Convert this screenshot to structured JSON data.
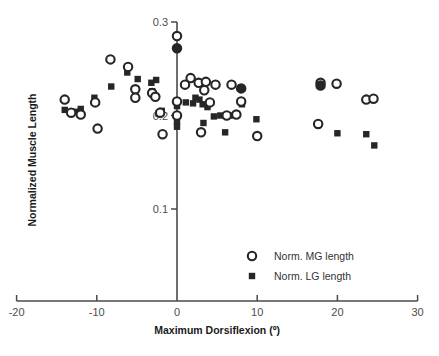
{
  "chart_data": {
    "type": "scatter",
    "title": "",
    "xlabel": "Maximum Dorsiflexion (º)",
    "ylabel": "Normalized Muscle Length",
    "xlim": [
      -20,
      30
    ],
    "ylim": [
      0.055,
      0.305
    ],
    "xticks": [
      -20,
      -10,
      0,
      10,
      20,
      30
    ],
    "xticklabels": [
      "-20",
      "-10",
      "0",
      "10",
      "20",
      "30"
    ],
    "yticks": [
      0.1,
      0.2,
      0.3
    ],
    "yticklabels": [
      "0.1",
      "0.2",
      "0.3"
    ],
    "grid": false,
    "legend_position": "lower right",
    "series": [
      {
        "name": "Norm. MG length",
        "marker": "open-circle",
        "color": "#262626",
        "points": [
          [
            -14.0,
            0.217
          ],
          [
            -13.2,
            0.203
          ],
          [
            -12.0,
            0.201
          ],
          [
            -10.2,
            0.214
          ],
          [
            -9.9,
            0.186
          ],
          [
            -8.3,
            0.26
          ],
          [
            -6.1,
            0.252
          ],
          [
            -5.2,
            0.228
          ],
          [
            -5.2,
            0.219
          ],
          [
            -3.1,
            0.224
          ],
          [
            -2.7,
            0.22
          ],
          [
            -2.1,
            0.203
          ],
          [
            -1.8,
            0.18
          ],
          [
            0.0,
            0.285
          ],
          [
            0.0,
            0.215
          ],
          [
            0.0,
            0.2
          ],
          [
            1.7,
            0.24
          ],
          [
            1.0,
            0.233
          ],
          [
            2.7,
            0.235
          ],
          [
            3.6,
            0.236
          ],
          [
            3.4,
            0.227
          ],
          [
            4.8,
            0.233
          ],
          [
            3.0,
            0.182
          ],
          [
            4.1,
            0.214
          ],
          [
            6.2,
            0.2
          ],
          [
            6.8,
            0.233
          ],
          [
            7.4,
            0.201
          ],
          [
            8.0,
            0.215
          ],
          [
            10.0,
            0.178
          ],
          [
            17.9,
            0.235
          ],
          [
            17.6,
            0.191
          ],
          [
            19.9,
            0.234
          ],
          [
            23.6,
            0.217
          ],
          [
            24.5,
            0.218
          ]
        ]
      },
      {
        "name": "Norm. LG length",
        "marker": "filled-square",
        "color": "#262626",
        "points": [
          [
            -14.0,
            0.206
          ],
          [
            -12.6,
            0.204
          ],
          [
            -12.0,
            0.207
          ],
          [
            -10.3,
            0.219
          ],
          [
            -8.2,
            0.231
          ],
          [
            -6.2,
            0.246
          ],
          [
            -5.2,
            0.224
          ],
          [
            -4.9,
            0.239
          ],
          [
            -3.2,
            0.235
          ],
          [
            -3.1,
            0.226
          ],
          [
            -2.6,
            0.238
          ],
          [
            -2.3,
            0.202
          ],
          [
            -1.9,
            0.205
          ],
          [
            0.0,
            0.216
          ],
          [
            0.0,
            0.21
          ],
          [
            0.0,
            0.193
          ],
          [
            0.0,
            0.188
          ],
          [
            1.1,
            0.214
          ],
          [
            2.0,
            0.213
          ],
          [
            2.3,
            0.219
          ],
          [
            2.8,
            0.217
          ],
          [
            3.2,
            0.212
          ],
          [
            3.8,
            0.209
          ],
          [
            3.3,
            0.192
          ],
          [
            4.6,
            0.199
          ],
          [
            5.4,
            0.2
          ],
          [
            6.0,
            0.182
          ],
          [
            6.6,
            0.2
          ],
          [
            8.0,
            0.229
          ],
          [
            8.1,
            0.212
          ],
          [
            9.9,
            0.196
          ],
          [
            17.6,
            0.19
          ],
          [
            17.9,
            0.232
          ],
          [
            20.0,
            0.181
          ],
          [
            23.6,
            0.18
          ],
          [
            24.6,
            0.168
          ]
        ]
      }
    ]
  },
  "legend": {
    "items": [
      {
        "label": "Norm. MG length",
        "marker": "open-circle"
      },
      {
        "label": "Norm. LG length",
        "marker": "filled-square"
      }
    ]
  }
}
